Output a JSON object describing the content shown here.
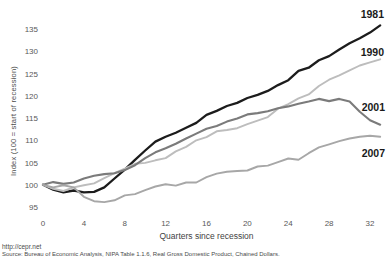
{
  "chart_data": {
    "type": "line",
    "title": "",
    "xlabel": "Quarters since recession",
    "ylabel": "Index (100 = start of recession)",
    "x_ticks": [
      0,
      4,
      8,
      12,
      16,
      20,
      24,
      28,
      32
    ],
    "y_ticks": [
      95,
      100,
      105,
      110,
      115,
      120,
      125,
      130,
      135
    ],
    "xlim": [
      0,
      33
    ],
    "ylim": [
      95,
      135
    ],
    "grid": false,
    "axis_lines": false,
    "legend_position": "labels-at-right-edge-of-lines",
    "x_step_per_point": 1,
    "series": [
      {
        "name": "1981",
        "color": "#1c1c1c",
        "width": 2.3,
        "values": [
          100,
          98.9,
          98.3,
          98.7,
          98.3,
          98.4,
          99.4,
          101.4,
          103.4,
          105.6,
          107.7,
          109.7,
          110.8,
          111.7,
          112.8,
          113.9,
          115.7,
          116.6,
          117.7,
          118.4,
          119.5,
          120.2,
          121.1,
          122.4,
          123.5,
          125.6,
          126.3,
          128.0,
          128.9,
          130.4,
          131.8,
          132.9,
          134.2,
          135.8
        ]
      },
      {
        "name": "1990",
        "color": "#bdbdbd",
        "width": 1.9,
        "values": [
          100,
          99.1,
          98.6,
          99.4,
          99.9,
          100.3,
          101.5,
          102.6,
          103.6,
          104.7,
          104.9,
          105.5,
          106.0,
          107.5,
          108.5,
          110.0,
          110.7,
          112.0,
          112.3,
          112.7,
          113.6,
          114.4,
          115.2,
          117.1,
          118.1,
          119.4,
          120.3,
          122.2,
          123.6,
          124.6,
          125.7,
          126.8,
          127.5,
          128.2
        ]
      },
      {
        "name": "2001",
        "color": "#7b7b7b",
        "width": 2.1,
        "values": [
          100,
          100.6,
          100.2,
          100.5,
          101.4,
          102.0,
          102.4,
          102.6,
          103.3,
          104.4,
          106.0,
          107.3,
          108.2,
          109.2,
          110.4,
          111.5,
          112.6,
          113.2,
          114.2,
          114.9,
          115.8,
          116.1,
          116.5,
          117.2,
          117.6,
          118.2,
          118.7,
          119.3,
          118.8,
          119.3,
          118.7,
          116.4,
          114.5,
          113.5
        ]
      },
      {
        "name": "2007",
        "color": "#a7a7a7",
        "width": 1.9,
        "values": [
          100,
          99.4,
          99.9,
          99.4,
          97.3,
          96.3,
          96.1,
          96.5,
          97.6,
          97.9,
          98.8,
          99.6,
          100.1,
          99.8,
          100.5,
          100.5,
          101.7,
          102.5,
          102.9,
          103.1,
          103.2,
          104.1,
          104.3,
          105.1,
          105.9,
          105.6,
          107.1,
          108.4,
          109.1,
          109.8,
          110.4,
          110.8,
          111.0,
          110.8
        ]
      }
    ]
  },
  "footer": {
    "url": "http://cepr.net",
    "source": "Source: Bureau of Economic Analysis, NIPA Table 1.1.6, Real Gross Domestic Product, Chained Dollars."
  }
}
